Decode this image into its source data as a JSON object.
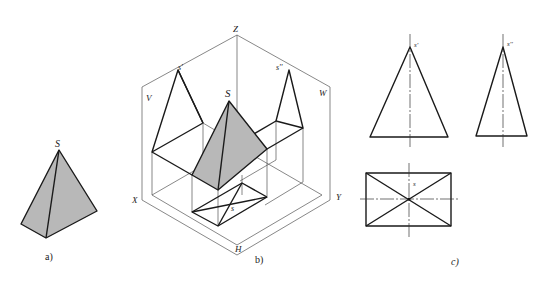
{
  "figure": {
    "panels": [
      {
        "id": "a",
        "caption": "a)",
        "description": "Isometric view of a triangular-face pyramid",
        "labels": {
          "apex": "S"
        },
        "fill_color": "#b8b8b8"
      },
      {
        "id": "b",
        "caption": "b)",
        "description": "Pyramid placed in three-projection-plane system with projections",
        "labels": {
          "apex": "S",
          "front_apex": "s'",
          "side_apex": "s''",
          "top_apex": "s",
          "axis_z": "Z",
          "axis_x": "X",
          "axis_y": "Y",
          "plane_v": "V",
          "plane_w": "W",
          "plane_h": "H"
        },
        "fill_color": "#b8b8b8"
      },
      {
        "id": "c",
        "caption": "c)",
        "description": "Three orthographic views of the pyramid",
        "labels": {
          "front_apex": "s'",
          "side_apex": "s''",
          "top_apex": "s"
        }
      }
    ]
  }
}
